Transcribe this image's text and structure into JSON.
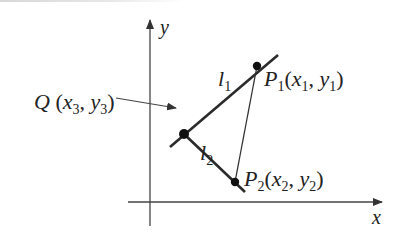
{
  "diagram": {
    "type": "coordinate-geometry",
    "axes": {
      "x_label": "x",
      "y_label": "y"
    },
    "points": [
      {
        "id": "Q",
        "name": "Q",
        "coords_text": "(x3, y3)",
        "sub": "3"
      },
      {
        "id": "P1",
        "name": "P",
        "name_sub": "1",
        "coords_x": "x",
        "coords_x_sub": "1",
        "coords_y": "y",
        "coords_y_sub": "1"
      },
      {
        "id": "P2",
        "name": "P",
        "name_sub": "2",
        "coords_x": "x",
        "coords_x_sub": "2",
        "coords_y": "y",
        "coords_y_sub": "2"
      }
    ],
    "lines": [
      {
        "id": "l1",
        "name": "l",
        "sub": "1"
      },
      {
        "id": "l2",
        "name": "l",
        "sub": "2"
      }
    ],
    "q_label": {
      "name": "Q",
      "x": "x",
      "x_sub": "3",
      "y": "y",
      "y_sub": "3"
    },
    "colors": {
      "line": "#2b2b2b",
      "axis": "#444444",
      "point": "#111111"
    }
  }
}
